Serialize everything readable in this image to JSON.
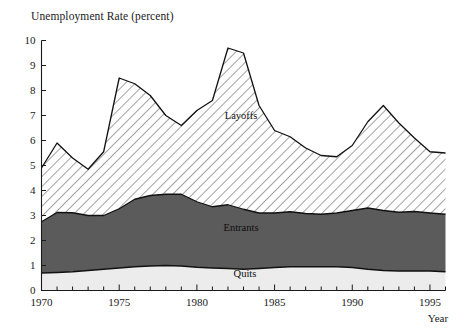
{
  "chart": {
    "title": "Unemployment Rate (percent)",
    "xlabel": "Year",
    "ylabel": ""
  },
  "axis": {
    "y_ticks": [
      "0",
      "1",
      "2",
      "3",
      "4",
      "5",
      "6",
      "7",
      "8",
      "9",
      "10"
    ],
    "x_ticks_labeled": [
      "1970",
      "1975",
      "1980",
      "1985",
      "1990",
      "1995"
    ]
  },
  "series_labels": {
    "layoffs": "Layoffs",
    "entrants": "Entrants",
    "quits": "Quits"
  },
  "colors": {
    "quits_fill": "#ececec",
    "entrants_fill": "#5b5b5b",
    "layoffs_fill": "#ffffff",
    "layoffs_hatch": "#555555",
    "axis": "#1a1a1a"
  },
  "chart_data": {
    "type": "area",
    "stacked": true,
    "title": "Unemployment Rate (percent)",
    "xlabel": "Year",
    "ylabel": "Unemployment Rate (percent)",
    "xlim": [
      1970,
      1996
    ],
    "ylim": [
      0,
      10
    ],
    "grid": false,
    "legend": "inline-labels",
    "x": [
      1970,
      1971,
      1972,
      1973,
      1974,
      1975,
      1976,
      1977,
      1978,
      1979,
      1980,
      1981,
      1982,
      1983,
      1984,
      1985,
      1986,
      1987,
      1988,
      1989,
      1990,
      1991,
      1992,
      1993,
      1994,
      1995,
      1996
    ],
    "series": [
      {
        "name": "Quits",
        "values": [
          0.7,
          0.72,
          0.75,
          0.8,
          0.85,
          0.9,
          0.95,
          0.98,
          1.0,
          0.98,
          0.93,
          0.9,
          0.88,
          0.85,
          0.88,
          0.92,
          0.95,
          0.95,
          0.95,
          0.95,
          0.92,
          0.85,
          0.8,
          0.78,
          0.78,
          0.78,
          0.75
        ]
      },
      {
        "name": "Entrants",
        "values": [
          2.05,
          2.4,
          2.36,
          2.2,
          2.15,
          2.37,
          2.7,
          2.82,
          2.85,
          2.87,
          2.62,
          2.45,
          2.55,
          2.4,
          2.22,
          2.18,
          2.2,
          2.13,
          2.1,
          2.15,
          2.28,
          2.45,
          2.4,
          2.35,
          2.38,
          2.32,
          2.3
        ]
      },
      {
        "name": "Layoffs",
        "values": [
          2.15,
          2.78,
          2.19,
          1.85,
          2.55,
          5.23,
          4.62,
          4.0,
          3.15,
          2.75,
          3.65,
          4.25,
          6.27,
          6.25,
          4.3,
          3.3,
          3.0,
          2.62,
          2.35,
          2.25,
          2.6,
          3.45,
          4.2,
          3.57,
          2.94,
          2.45,
          2.45
        ]
      }
    ],
    "totals": [
      4.9,
      5.9,
      5.3,
      4.85,
      5.55,
      8.5,
      8.27,
      7.8,
      7.0,
      6.6,
      7.2,
      7.6,
      9.7,
      9.5,
      7.4,
      6.4,
      6.15,
      5.7,
      5.4,
      5.35,
      5.8,
      6.75,
      7.4,
      6.7,
      6.1,
      5.55,
      5.5
    ]
  }
}
